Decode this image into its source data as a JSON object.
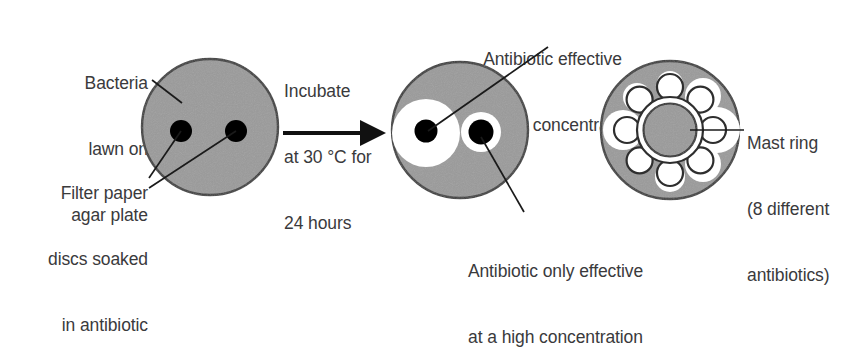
{
  "figure": {
    "background_color": "#ffffff",
    "agar_color": "#9a9a9a",
    "agar_edge_color": "#3d3d3d",
    "clear_zone_color": "#ffffff",
    "disc_color": "#000000",
    "text_color": "#3a3a3c",
    "leader_line_color": "#1a1a1a"
  },
  "labels": {
    "bacteria_lawn": {
      "line1": "Bacteria",
      "line2": "lawn on",
      "line3": "agar plate"
    },
    "filter_paper": {
      "line1": "Filter paper",
      "line2": "discs soaked",
      "line3": "in antibiotic"
    },
    "incubate": {
      "line1": "Incubate",
      "line2": "at 30 °C for",
      "line3": "24 hours"
    },
    "low_concentration": {
      "line1": "Antibiotic effective",
      "line2": "at a low concentration"
    },
    "high_concentration": {
      "line1": "Antibiotic only effective",
      "line2": "at a high concentration"
    },
    "mast_ring": {
      "line1": "Mast ring",
      "line2": "(8 different",
      "line3": "antibiotics)"
    }
  },
  "plates": {
    "before": {
      "name": "agar plate before incubation",
      "disc_count": 2,
      "clear_zones": 0
    },
    "after": {
      "name": "agar plate after incubation",
      "disc_count": 2,
      "clear_zones": 2,
      "large_zone_label": "low concentration effective",
      "small_zone_label": "high concentration only"
    },
    "mast_ring_plate": {
      "name": "Mast ring plate",
      "antibiotic_count": "8",
      "arm_count": "8"
    }
  },
  "arrow": {
    "name": "incubation-arrow",
    "direction": "right"
  }
}
